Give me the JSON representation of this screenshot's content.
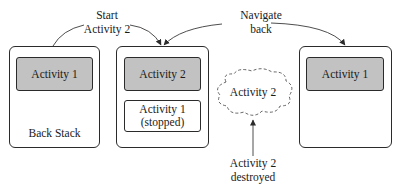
{
  "diagram": {
    "type": "activity-back-stack-lifecycle",
    "colors": {
      "border": "#2b2b2b",
      "active_fill": "#c2c2c2",
      "stopped_fill": "#ffffff",
      "text": "#1a1a1a"
    },
    "transitions": {
      "start": {
        "line1": "Start",
        "line2": "Activity 2"
      },
      "back": {
        "line1": "Navigate",
        "line2": "back"
      }
    },
    "stacks": [
      {
        "id": "stack-1",
        "top": "Activity 1",
        "caption": "Back Stack"
      },
      {
        "id": "stack-2",
        "top": "Activity 2",
        "below": {
          "line1": "Activity 1",
          "line2": "(stopped)"
        }
      },
      {
        "id": "stack-3",
        "top": "Activity 1"
      }
    ],
    "destroyed": {
      "cloud_label": "Activity 2",
      "caption_line1": "Activity 2",
      "caption_line2": "destroyed"
    }
  }
}
